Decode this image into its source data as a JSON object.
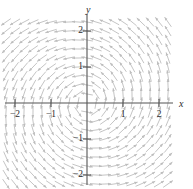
{
  "figure": {
    "kind": "direction-field-plot",
    "width": 193,
    "height": 189,
    "background": "#ffffff"
  },
  "axes": {
    "x_label": "x",
    "y_label": "y",
    "axis_color": "#555555",
    "origin_px": {
      "x": 87,
      "y": 103
    },
    "unit_px": 36,
    "x_axis_label_pos": {
      "x": 179,
      "y": 99
    },
    "y_axis_label_pos": {
      "x": 86,
      "y": 5
    },
    "xlim": [
      -2.35,
      2.35
    ],
    "ylim": [
      -2.35,
      2.35
    ],
    "grid": false,
    "x_ticks": [
      {
        "value": -2,
        "label": "−2",
        "px": 15
      },
      {
        "value": -1,
        "label": "−1",
        "px": 51
      },
      {
        "value": 1,
        "label": "1",
        "px": 123
      },
      {
        "value": 2,
        "label": "2",
        "px": 159
      }
    ],
    "y_ticks": [
      {
        "value": 2,
        "label": "2",
        "px": 31
      },
      {
        "value": 1,
        "label": "1",
        "px": 67
      },
      {
        "value": -1,
        "label": "−1",
        "px": 139
      },
      {
        "value": -2,
        "label": "−2",
        "px": 175
      }
    ]
  },
  "chart_data": {
    "type": "quiver",
    "title": "",
    "xlabel": "x",
    "ylabel": "y",
    "xlim": [
      -2.35,
      2.35
    ],
    "ylim": [
      -2.35,
      2.35
    ],
    "grid": false,
    "legend": null,
    "arrow_color": "#b9b9b9",
    "arrow_length_px": 11,
    "field": {
      "description": "Rotational / spiral direction field about the origin",
      "u_expression": "-y + 0.18*x",
      "v_expression": "x + 0.18*y",
      "sample_step": 0.25,
      "sample_x_range": [
        -2.25,
        2.25
      ],
      "sample_y_range": [
        -2.25,
        2.25
      ]
    },
    "sample_points": [
      {
        "x": -2.0,
        "y": 2.0,
        "u": -2.36,
        "v": -1.64
      },
      {
        "x": -1.0,
        "y": 2.0,
        "u": -2.18,
        "v": -0.64
      },
      {
        "x": 0.0,
        "y": 2.0,
        "u": -2.0,
        "v": 0.36
      },
      {
        "x": 1.0,
        "y": 2.0,
        "u": -1.82,
        "v": 1.36
      },
      {
        "x": 2.0,
        "y": 2.0,
        "u": -1.64,
        "v": 2.36
      },
      {
        "x": -2.0,
        "y": 1.0,
        "u": -1.36,
        "v": -1.82
      },
      {
        "x": -1.0,
        "y": 1.0,
        "u": -1.18,
        "v": -0.82
      },
      {
        "x": 1.0,
        "y": 1.0,
        "u": -0.82,
        "v": 1.18
      },
      {
        "x": 2.0,
        "y": 1.0,
        "u": -0.64,
        "v": 2.18
      },
      {
        "x": -2.0,
        "y": 0.0,
        "u": -0.36,
        "v": -2.0
      },
      {
        "x": -1.0,
        "y": 0.0,
        "u": -0.18,
        "v": -1.0
      },
      {
        "x": 1.0,
        "y": 0.0,
        "u": 0.18,
        "v": 1.0
      },
      {
        "x": 2.0,
        "y": 0.0,
        "u": 0.36,
        "v": 2.0
      },
      {
        "x": -2.0,
        "y": -1.0,
        "u": 0.64,
        "v": -2.18
      },
      {
        "x": -1.0,
        "y": -1.0,
        "u": 0.82,
        "v": -1.18
      },
      {
        "x": 1.0,
        "y": -1.0,
        "u": 1.18,
        "v": 0.82
      },
      {
        "x": 2.0,
        "y": -1.0,
        "u": 1.36,
        "v": 1.82
      },
      {
        "x": -2.0,
        "y": -2.0,
        "u": 1.64,
        "v": -2.36
      },
      {
        "x": -1.0,
        "y": -2.0,
        "u": 1.82,
        "v": -1.36
      },
      {
        "x": 0.0,
        "y": -2.0,
        "u": 2.0,
        "v": -0.36
      },
      {
        "x": 1.0,
        "y": -2.0,
        "u": 2.18,
        "v": 0.64
      },
      {
        "x": 2.0,
        "y": -2.0,
        "u": 2.36,
        "v": 1.64
      }
    ]
  }
}
